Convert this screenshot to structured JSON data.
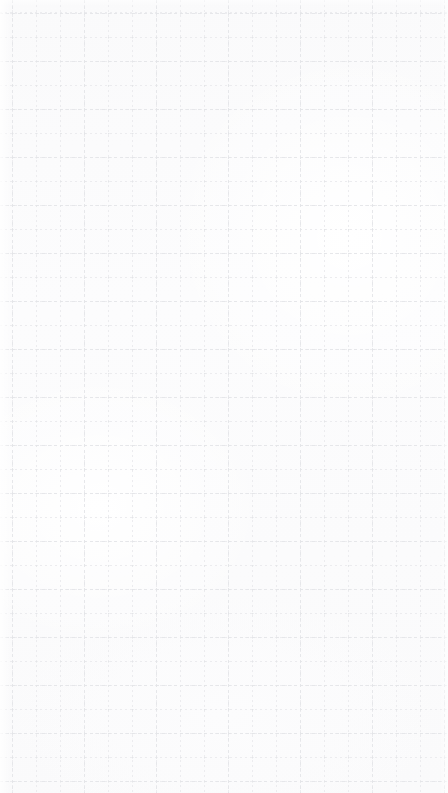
{
  "canvas": {
    "width": 448,
    "height": 793,
    "state": "empty",
    "content_items": [],
    "background": {
      "name": "grid-paper",
      "paper_color": "#fbfbfc",
      "page_color": "#ffffff"
    },
    "grid": {
      "visible": true,
      "style": "dashed",
      "minor": {
        "spacing_px": 24,
        "offset_x_px": 12,
        "offset_y_px": 13,
        "color": "#ececef",
        "dash_px": 2,
        "gap_px": 3,
        "thickness_px": 1
      },
      "major": {
        "spacing_x_px": 72,
        "spacing_y_px": 48,
        "offset_x_px": 12,
        "offset_y_px": 13,
        "color": "#e6e7ea",
        "dash_px": 3,
        "gap_px": 3,
        "thickness_px": 1
      },
      "nodes": {
        "visible": true,
        "color": "#e4e5e8",
        "radius_px": 1
      }
    },
    "accessible_label": "Empty grid canvas"
  }
}
